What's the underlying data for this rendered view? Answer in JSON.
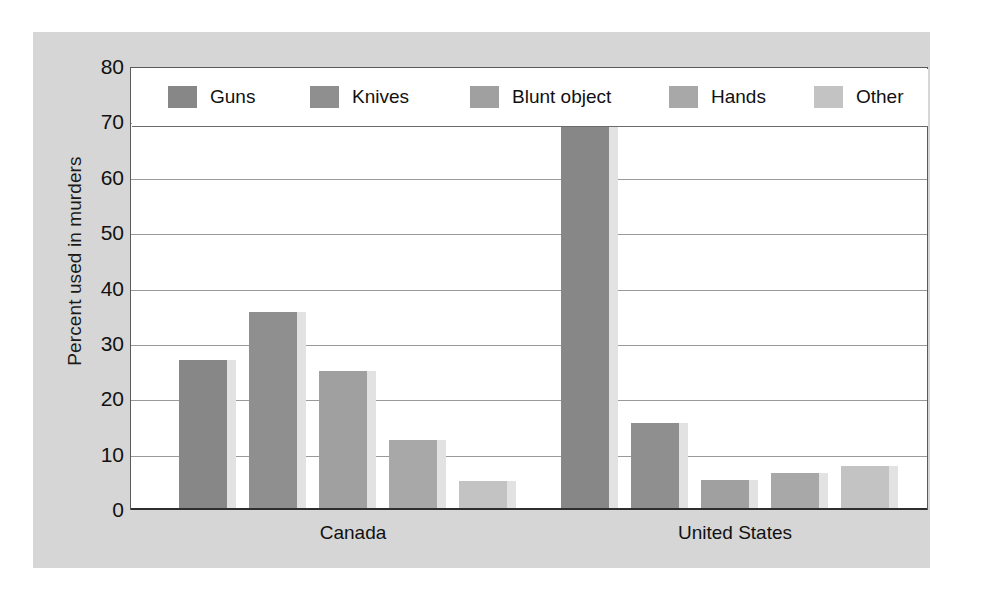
{
  "chart_data": {
    "type": "bar",
    "title": "",
    "xlabel": "",
    "ylabel": "Percent used in murders",
    "ylim": [
      0,
      80
    ],
    "ytick_step": 10,
    "yticks": [
      "80",
      "70",
      "60",
      "50",
      "40",
      "30",
      "20",
      "10",
      "0"
    ],
    "grid": true,
    "gridlines_at": [
      10,
      20,
      30,
      40,
      50,
      60,
      70
    ],
    "legend_position": "top-inside",
    "categories": [
      "Canada",
      "United States"
    ],
    "series": [
      {
        "name": "Guns",
        "color": "#878787",
        "values": [
          27.0,
          70.0
        ]
      },
      {
        "name": "Knives",
        "color": "#8f8f8f",
        "values": [
          35.5,
          15.5
        ]
      },
      {
        "name": "Blunt object",
        "color": "#a0a0a0",
        "values": [
          25.0,
          5.3
        ]
      },
      {
        "name": "Hands",
        "color": "#a8a8a8",
        "values": [
          12.5,
          6.5
        ]
      },
      {
        "name": "Other",
        "color": "#c3c3c3",
        "values": [
          5.0,
          7.8
        ]
      }
    ]
  },
  "legend": {
    "items": [
      {
        "label": "Guns",
        "color": "#878787"
      },
      {
        "label": "Knives",
        "color": "#8f8f8f"
      },
      {
        "label": "Blunt object",
        "color": "#a0a0a0"
      },
      {
        "label": "Hands",
        "color": "#a8a8a8"
      },
      {
        "label": "Other",
        "color": "#c3c3c3"
      }
    ]
  },
  "axes": {
    "y_title": "Percent used in murders",
    "y_ticks": [
      "80",
      "70",
      "60",
      "50",
      "40",
      "30",
      "20",
      "10",
      "0"
    ],
    "x_ticks": [
      "Canada",
      "United States"
    ]
  },
  "colors": {
    "panel_background": "#d6d6d6",
    "plot_background": "#ffffff",
    "gridline": "#9a9a9a",
    "axis_line": "#2e2e2e",
    "bar_shadow": "#e2e2e2",
    "text": "#111111"
  }
}
